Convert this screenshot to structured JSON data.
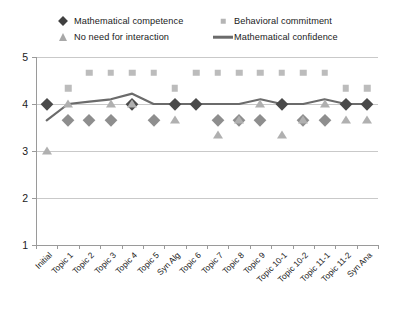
{
  "chart_data": {
    "type": "line",
    "title": "",
    "xlabel": "",
    "ylabel": "",
    "ylim": [
      1,
      5
    ],
    "yticks": [
      1,
      2,
      3,
      4,
      5
    ],
    "grid": true,
    "legend_position": "top",
    "categories": [
      "Initial",
      "Topic 1",
      "Topic 2",
      "Topic 3",
      "Topic 4",
      "Topic 5",
      "Syn Alg",
      "Topic 6",
      "Topic 7",
      "Topic 8",
      "Topic 9",
      "Topic 10-1",
      "Topic 10-2",
      "Topic 11-1",
      "Topic 11-2",
      "Syn Ana"
    ],
    "series": [
      {
        "name": "Mathematical competence",
        "marker": "diamond",
        "color": "#4a4a4a",
        "values": [
          4.0,
          3.67,
          3.67,
          3.67,
          4.0,
          3.67,
          4.0,
          4.0,
          3.67,
          3.67,
          3.67,
          4.0,
          3.67,
          3.67,
          4.0,
          4.0
        ]
      },
      {
        "name": "Behavioral commitment",
        "marker": "square",
        "color": "#bcbcbc",
        "values": [
          null,
          4.33,
          4.67,
          4.67,
          4.67,
          4.67,
          4.33,
          4.67,
          4.67,
          4.67,
          4.67,
          4.67,
          4.67,
          4.67,
          4.33,
          4.33
        ]
      },
      {
        "name": "No need for interaction",
        "marker": "triangle",
        "color": "#b0b0b0",
        "values": [
          3.0,
          4.0,
          null,
          4.0,
          4.0,
          null,
          3.67,
          null,
          3.33,
          3.67,
          4.0,
          3.33,
          3.67,
          4.0,
          3.67,
          3.67
        ]
      },
      {
        "name": "Mathematical confidence",
        "marker": "line",
        "color": "#6b6b6b",
        "values": [
          3.65,
          4.0,
          4.05,
          4.1,
          4.22,
          4.0,
          4.0,
          4.0,
          4.0,
          4.0,
          4.1,
          4.0,
          4.0,
          4.1,
          4.0,
          4.0
        ]
      }
    ]
  },
  "legend": {
    "items": [
      {
        "label": "Mathematical competence",
        "marker": "diamond-marker"
      },
      {
        "label": "No need for interaction",
        "marker": "triangle-marker"
      },
      {
        "label": "Behavioral commitment",
        "marker": "square-marker"
      },
      {
        "label": "Mathematical confidence",
        "marker": "line-marker"
      }
    ]
  }
}
